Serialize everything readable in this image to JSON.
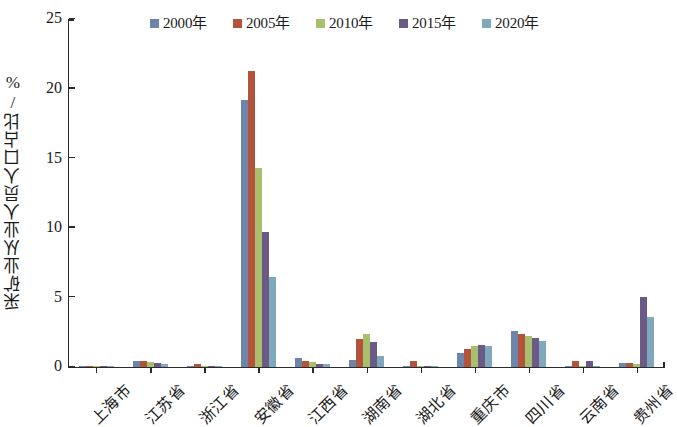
{
  "chart_data": {
    "type": "bar",
    "title": "",
    "xlabel": "",
    "ylabel": "采矿业从业人员人口占比/%",
    "ylim": [
      0,
      25
    ],
    "yticks": [
      0,
      5,
      10,
      15,
      20,
      25
    ],
    "grid": false,
    "legend_position": "top-center",
    "categories": [
      "上海市",
      "江苏省",
      "浙江省",
      "安徽省",
      "江西省",
      "湖南省",
      "湖北省",
      "重庆市",
      "四川省",
      "云南省",
      "贵州省"
    ],
    "series": [
      {
        "name": "2000年",
        "color": "#6e85ab",
        "values": [
          0.05,
          0.45,
          0.05,
          19.2,
          0.65,
          0.5,
          0.05,
          1.0,
          2.6,
          0.05,
          0.3
        ]
      },
      {
        "name": "2005年",
        "color": "#b4533c",
        "values": [
          0.05,
          0.4,
          0.25,
          21.3,
          0.4,
          2.0,
          0.4,
          1.3,
          2.4,
          0.4,
          0.3
        ]
      },
      {
        "name": "2010年",
        "color": "#a8bf6e",
        "values": [
          0.05,
          0.35,
          0.1,
          14.3,
          0.35,
          2.4,
          0.1,
          1.5,
          2.2,
          0.1,
          0.25
        ]
      },
      {
        "name": "2015年",
        "color": "#6b5a86",
        "values": [
          0.05,
          0.3,
          0.08,
          9.7,
          0.25,
          1.8,
          0.1,
          1.6,
          2.1,
          0.4,
          5.0
        ]
      },
      {
        "name": "2020年",
        "color": "#7fa8bd",
        "values": [
          0.05,
          0.25,
          0.05,
          6.5,
          0.2,
          0.8,
          0.08,
          1.5,
          1.9,
          0.05,
          3.6
        ]
      }
    ]
  }
}
